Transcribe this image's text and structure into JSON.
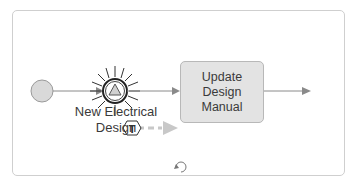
{
  "diagram": {
    "type": "BPMN process",
    "start_event": {
      "label": ""
    },
    "intermediate_event": {
      "label": "New Electrical Design",
      "label_line1": "New Electrical",
      "label_line2": "Design",
      "icon": "signal-triangle-icon",
      "badge": "T"
    },
    "task": {
      "label": "Update Design Manual",
      "line1": "Update",
      "line2": "Design",
      "line3": "Manual"
    },
    "footer_icon": "loop-icon",
    "colors": {
      "border": "#cfcfcf",
      "task_fill": "#e3e3e3",
      "event_fill": "#d9d9d9",
      "flow": "#8a8a8a",
      "dashed_flow": "#c8c8c8"
    }
  }
}
